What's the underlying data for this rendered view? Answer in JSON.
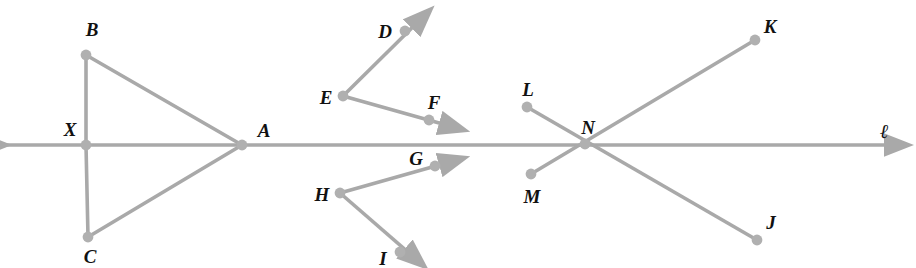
{
  "figure": {
    "background_color": "#ffffff",
    "stroke_color": "#a9a9a9",
    "dot_color": "#b0b0b0",
    "label_color": "#111111",
    "width": 916,
    "height": 268
  },
  "line": {
    "name": "l",
    "label": "ℓ",
    "label_position": {
      "x": 884,
      "y": 131
    },
    "left_arrow_tip": {
      "x": 6,
      "y": 145
    },
    "right_arrow_tip": {
      "x": 908,
      "y": 145
    },
    "y": 145
  },
  "points": [
    {
      "id": "B",
      "label": "B",
      "dot": {
        "x": 86,
        "y": 55
      },
      "label_pos": {
        "x": 92,
        "y": 29
      }
    },
    {
      "id": "X",
      "label": "X",
      "dot": {
        "x": 86,
        "y": 145
      },
      "label_pos": {
        "x": 70,
        "y": 129
      }
    },
    {
      "id": "C",
      "label": "C",
      "dot": {
        "x": 88,
        "y": 237
      },
      "label_pos": {
        "x": 90,
        "y": 256
      }
    },
    {
      "id": "A",
      "label": "A",
      "dot": {
        "x": 242,
        "y": 145
      },
      "label_pos": {
        "x": 264,
        "y": 130
      }
    },
    {
      "id": "D",
      "label": "D",
      "dot": {
        "x": 405,
        "y": 31
      },
      "label_pos": {
        "x": 385,
        "y": 31
      }
    },
    {
      "id": "E",
      "label": "E",
      "dot": {
        "x": 343,
        "y": 96
      },
      "label_pos": {
        "x": 326,
        "y": 97
      }
    },
    {
      "id": "F",
      "label": "F",
      "dot": {
        "x": 429,
        "y": 120
      },
      "label_pos": {
        "x": 434,
        "y": 102
      }
    },
    {
      "id": "G",
      "label": "G",
      "dot": {
        "x": 435,
        "y": 166
      },
      "label_pos": {
        "x": 416,
        "y": 158
      }
    },
    {
      "id": "H",
      "label": "H",
      "dot": {
        "x": 340,
        "y": 193
      },
      "label_pos": {
        "x": 322,
        "y": 194
      }
    },
    {
      "id": "I",
      "label": "I",
      "dot": {
        "x": 400,
        "y": 252
      },
      "label_pos": {
        "x": 383,
        "y": 258
      }
    },
    {
      "id": "L",
      "label": "L",
      "dot": {
        "x": 527,
        "y": 107
      },
      "label_pos": {
        "x": 528,
        "y": 89
      }
    },
    {
      "id": "N",
      "label": "N",
      "dot": {
        "x": 585,
        "y": 144
      },
      "label_pos": {
        "x": 588,
        "y": 127
      }
    },
    {
      "id": "M",
      "label": "M",
      "dot": {
        "x": 531,
        "y": 174
      },
      "label_pos": {
        "x": 532,
        "y": 196
      }
    },
    {
      "id": "K",
      "label": "K",
      "dot": {
        "x": 755,
        "y": 40
      },
      "label_pos": {
        "x": 770,
        "y": 26
      }
    },
    {
      "id": "J",
      "label": "J",
      "dot": {
        "x": 757,
        "y": 240
      },
      "label_pos": {
        "x": 771,
        "y": 222
      }
    }
  ],
  "segments": [
    {
      "name": "X-B",
      "from": "X",
      "to": "B",
      "x1": 86,
      "y1": 145,
      "x2": 86,
      "y2": 55,
      "arrow": false
    },
    {
      "name": "X-C",
      "from": "X",
      "to": "C",
      "x1": 86,
      "y1": 145,
      "x2": 88,
      "y2": 237,
      "arrow": false
    },
    {
      "name": "B-A",
      "from": "B",
      "to": "A",
      "x1": 86,
      "y1": 55,
      "x2": 242,
      "y2": 145,
      "arrow": false
    },
    {
      "name": "C-A",
      "from": "C",
      "to": "A",
      "x1": 88,
      "y1": 237,
      "x2": 242,
      "y2": 145,
      "arrow": false
    },
    {
      "name": "E-D-ray",
      "from": "E",
      "to": "D",
      "x1": 343,
      "y1": 96,
      "x2": 430,
      "y2": 10,
      "arrow": true
    },
    {
      "name": "E-F-ray",
      "from": "E",
      "to": "F",
      "x1": 343,
      "y1": 96,
      "x2": 464,
      "y2": 130,
      "arrow": true
    },
    {
      "name": "H-G-ray",
      "from": "H",
      "to": "G",
      "x1": 340,
      "y1": 193,
      "x2": 464,
      "y2": 158,
      "arrow": true
    },
    {
      "name": "H-I-ray",
      "from": "H",
      "to": "I",
      "x1": 340,
      "y1": 193,
      "x2": 424,
      "y2": 266,
      "arrow": true
    },
    {
      "name": "L-N-J",
      "from": "L",
      "to": "J",
      "x1": 527,
      "y1": 107,
      "x2": 757,
      "y2": 240,
      "arrow": false
    },
    {
      "name": "M-N-K",
      "from": "M",
      "to": "K",
      "x1": 531,
      "y1": 174,
      "x2": 755,
      "y2": 40,
      "arrow": false
    }
  ]
}
